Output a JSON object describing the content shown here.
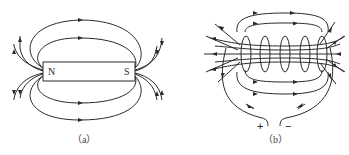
{
  "figure_a": {
    "caption": "（a）",
    "subject": "bar magnet field lines",
    "magnet": {
      "north_label": "N",
      "south_label": "S"
    }
  },
  "figure_b": {
    "caption": "（b）",
    "subject": "solenoid field lines",
    "terminals": {
      "positive_label": "+",
      "negative_label": "−"
    }
  }
}
